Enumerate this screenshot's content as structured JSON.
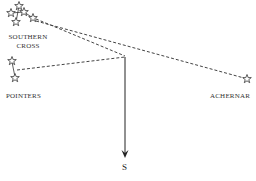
{
  "diagram": {
    "labels": {
      "southern_cross_line1": "SOUTHERN",
      "southern_cross_line2": "CROSS",
      "pointers": "POINTERS",
      "achernar": "ACHERNAR",
      "south": "S"
    },
    "colors": {
      "ink": "#333333",
      "background": "#ffffff"
    },
    "stars": {
      "southern_cross": [
        {
          "x": 11,
          "y": 13
        },
        {
          "x": 19,
          "y": 6
        },
        {
          "x": 24,
          "y": 12
        },
        {
          "x": 16,
          "y": 22
        },
        {
          "x": 33,
          "y": 18
        }
      ],
      "pointers": [
        {
          "x": 12,
          "y": 61
        },
        {
          "x": 15,
          "y": 78
        }
      ],
      "achernar": {
        "x": 247,
        "y": 79
      }
    },
    "lines": {
      "convergence_point": {
        "x": 125,
        "y": 58
      },
      "south_arrow_end": {
        "x": 125,
        "y": 157
      }
    }
  }
}
